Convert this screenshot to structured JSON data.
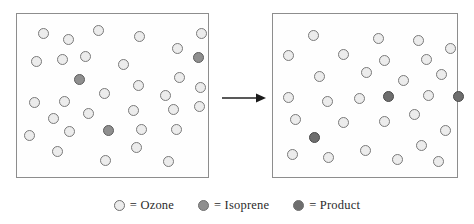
{
  "diagram": {
    "arrow": {
      "name": "reaction-arrow",
      "direction": "right"
    },
    "colors": {
      "ozone": "#ececec",
      "isoprene": "#8f8f8f",
      "product": "#6e6e6e",
      "box_border": "#8d8d8d",
      "circle_outline": "#6f6f6f",
      "background": "#ffffff",
      "text": "#2b2b2b"
    },
    "panels": [
      {
        "name": "before-box",
        "label": "Before reaction",
        "molecules": [
          {
            "type": "ozone",
            "x": 21,
            "y": 14,
            "d": 11
          },
          {
            "type": "ozone",
            "x": 46,
            "y": 20,
            "d": 11
          },
          {
            "type": "ozone",
            "x": 76,
            "y": 11,
            "d": 11
          },
          {
            "type": "ozone",
            "x": 117,
            "y": 17,
            "d": 11
          },
          {
            "type": "ozone",
            "x": 155,
            "y": 29,
            "d": 11
          },
          {
            "type": "ozone",
            "x": 179,
            "y": 14,
            "d": 11
          },
          {
            "type": "ozone",
            "x": 14,
            "y": 42,
            "d": 11
          },
          {
            "type": "ozone",
            "x": 40,
            "y": 40,
            "d": 11
          },
          {
            "type": "ozone",
            "x": 63,
            "y": 37,
            "d": 11
          },
          {
            "type": "ozone",
            "x": 101,
            "y": 45,
            "d": 11
          },
          {
            "type": "isoprene",
            "x": 176,
            "y": 38,
            "d": 11
          },
          {
            "type": "ozone",
            "x": 157,
            "y": 58,
            "d": 11
          },
          {
            "type": "isoprene",
            "x": 57,
            "y": 60,
            "d": 11
          },
          {
            "type": "ozone",
            "x": 116,
            "y": 66,
            "d": 11
          },
          {
            "type": "ozone",
            "x": 178,
            "y": 68,
            "d": 11
          },
          {
            "type": "ozone",
            "x": 12,
            "y": 83,
            "d": 11
          },
          {
            "type": "ozone",
            "x": 42,
            "y": 82,
            "d": 11
          },
          {
            "type": "ozone",
            "x": 82,
            "y": 74,
            "d": 11
          },
          {
            "type": "ozone",
            "x": 143,
            "y": 76,
            "d": 11
          },
          {
            "type": "ozone",
            "x": 31,
            "y": 99,
            "d": 11
          },
          {
            "type": "ozone",
            "x": 66,
            "y": 94,
            "d": 11
          },
          {
            "type": "ozone",
            "x": 111,
            "y": 91,
            "d": 11
          },
          {
            "type": "ozone",
            "x": 151,
            "y": 90,
            "d": 11
          },
          {
            "type": "ozone",
            "x": 177,
            "y": 87,
            "d": 11
          },
          {
            "type": "ozone",
            "x": 7,
            "y": 116,
            "d": 11
          },
          {
            "type": "ozone",
            "x": 47,
            "y": 112,
            "d": 11
          },
          {
            "type": "isoprene",
            "x": 86,
            "y": 111,
            "d": 11
          },
          {
            "type": "ozone",
            "x": 119,
            "y": 110,
            "d": 11
          },
          {
            "type": "ozone",
            "x": 154,
            "y": 110,
            "d": 11
          },
          {
            "type": "ozone",
            "x": 35,
            "y": 132,
            "d": 11
          },
          {
            "type": "ozone",
            "x": 114,
            "y": 128,
            "d": 11
          },
          {
            "type": "ozone",
            "x": 83,
            "y": 141,
            "d": 11
          },
          {
            "type": "ozone",
            "x": 146,
            "y": 142,
            "d": 11
          }
        ]
      },
      {
        "name": "after-box",
        "label": "After reaction",
        "molecules": [
          {
            "type": "ozone",
            "x": 35,
            "y": 16,
            "d": 11
          },
          {
            "type": "ozone",
            "x": 100,
            "y": 19,
            "d": 11
          },
          {
            "type": "ozone",
            "x": 140,
            "y": 21,
            "d": 11
          },
          {
            "type": "ozone",
            "x": 172,
            "y": 29,
            "d": 11
          },
          {
            "type": "ozone",
            "x": 10,
            "y": 36,
            "d": 11
          },
          {
            "type": "ozone",
            "x": 65,
            "y": 35,
            "d": 11
          },
          {
            "type": "ozone",
            "x": 106,
            "y": 41,
            "d": 11
          },
          {
            "type": "ozone",
            "x": 148,
            "y": 40,
            "d": 11
          },
          {
            "type": "ozone",
            "x": 88,
            "y": 53,
            "d": 11
          },
          {
            "type": "ozone",
            "x": 163,
            "y": 55,
            "d": 11
          },
          {
            "type": "ozone",
            "x": 41,
            "y": 57,
            "d": 11
          },
          {
            "type": "ozone",
            "x": 125,
            "y": 61,
            "d": 11
          },
          {
            "type": "ozone",
            "x": 10,
            "y": 78,
            "d": 11
          },
          {
            "type": "ozone",
            "x": 49,
            "y": 82,
            "d": 11
          },
          {
            "type": "ozone",
            "x": 81,
            "y": 79,
            "d": 11
          },
          {
            "type": "product",
            "x": 110,
            "y": 77,
            "d": 11
          },
          {
            "type": "ozone",
            "x": 150,
            "y": 76,
            "d": 11
          },
          {
            "type": "product",
            "x": 180,
            "y": 77,
            "d": 11
          },
          {
            "type": "ozone",
            "x": 17,
            "y": 100,
            "d": 11
          },
          {
            "type": "ozone",
            "x": 65,
            "y": 103,
            "d": 11
          },
          {
            "type": "ozone",
            "x": 106,
            "y": 102,
            "d": 11
          },
          {
            "type": "ozone",
            "x": 136,
            "y": 95,
            "d": 11
          },
          {
            "type": "product",
            "x": 36,
            "y": 118,
            "d": 11
          },
          {
            "type": "ozone",
            "x": 167,
            "y": 111,
            "d": 11
          },
          {
            "type": "ozone",
            "x": 143,
            "y": 126,
            "d": 11
          },
          {
            "type": "ozone",
            "x": 14,
            "y": 135,
            "d": 11
          },
          {
            "type": "ozone",
            "x": 50,
            "y": 138,
            "d": 11
          },
          {
            "type": "ozone",
            "x": 87,
            "y": 131,
            "d": 11
          },
          {
            "type": "ozone",
            "x": 119,
            "y": 140,
            "d": 11
          },
          {
            "type": "ozone",
            "x": 160,
            "y": 142,
            "d": 11
          }
        ]
      }
    ]
  },
  "legend": {
    "name": "molecule-legend",
    "items": [
      {
        "swatch": "ozone",
        "label": "= Ozone"
      },
      {
        "swatch": "isoprene",
        "label": "= Isoprene"
      },
      {
        "swatch": "product",
        "label": "= Product"
      }
    ]
  }
}
